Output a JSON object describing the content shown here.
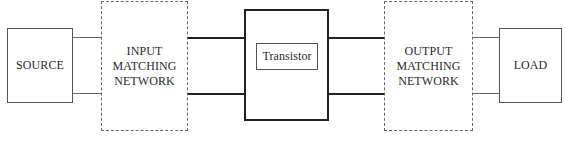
{
  "diagram": {
    "type": "block-diagram",
    "title": "",
    "blocks": {
      "source": {
        "label": "SOURCE",
        "style": "solid"
      },
      "input_matching_network": {
        "label": "INPUT MATCHING NETWORK",
        "lines": [
          "INPUT",
          "MATCHING",
          "NETWORK"
        ],
        "style": "dashed"
      },
      "transistor": {
        "label": "Transistor",
        "style": "solid-heavy"
      },
      "output_matching_network": {
        "label": "OUTPUT MATCHING NETWORK",
        "lines": [
          "OUTPUT",
          "MATCHING",
          "NETWORK"
        ],
        "style": "dashed"
      },
      "load": {
        "label": "LOAD",
        "style": "solid"
      }
    },
    "connections": [
      {
        "from": "source",
        "to": "input_matching_network",
        "wires": 2
      },
      {
        "from": "input_matching_network",
        "to": "transistor",
        "wires": 2
      },
      {
        "from": "transistor",
        "to": "output_matching_network",
        "wires": 2
      },
      {
        "from": "output_matching_network",
        "to": "load",
        "wires": 2
      }
    ],
    "colors": {
      "background": "#ffffff",
      "stroke": "#555555",
      "heavy_stroke": "#222222",
      "text": "#2a2a2a"
    }
  }
}
